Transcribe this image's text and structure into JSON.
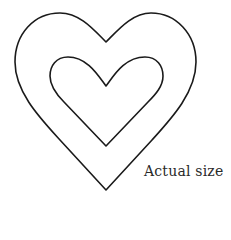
{
  "figure": {
    "caption": "Actual size",
    "stroke_color": "#1a1a1a",
    "background": "#ffffff",
    "shapes": [
      {
        "name": "outer-heart",
        "type": "heart outline"
      },
      {
        "name": "inner-heart",
        "type": "heart outline"
      }
    ]
  }
}
